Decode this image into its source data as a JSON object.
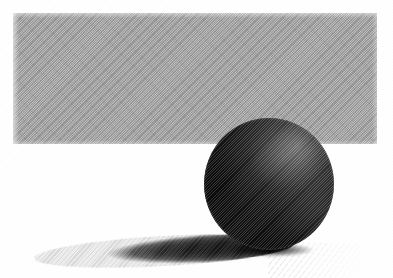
{
  "image": {
    "title": "Dark sphere resting on a surface in front of a gray band",
    "medium": "grayscale halftone print",
    "width_px": 393,
    "height_px": 278,
    "background_color": "#ffffff"
  },
  "objects": {
    "band": {
      "name": "gray background band",
      "shape": "rectangle",
      "color": "#ababab",
      "x_px": 13,
      "y_px": 13,
      "width_px": 364,
      "height_px": 131,
      "texture": "diagonal halftone screen"
    },
    "sphere": {
      "name": "dark sphere",
      "shape": "circle",
      "color_dark": "#151515",
      "color_light": "#7a7a7a",
      "x_px": 204,
      "y_px": 118,
      "diameter_px": 130,
      "highlight_position": "upper right",
      "texture": "diagonal halftone screen"
    },
    "shadow": {
      "name": "cast shadow",
      "shape": "ellipse",
      "color": "#161616",
      "x_px": 34,
      "y_px": 236,
      "width_px": 260,
      "height_px": 30,
      "direction": "to the left of the sphere",
      "rotation_deg": -3.2
    },
    "floor_streaks": {
      "name": "faint floor streaks",
      "color": "#000000",
      "opacity": 0.085,
      "x_px": 268,
      "y_px": 243,
      "width_px": 125,
      "height_px": 35
    },
    "contact": {
      "name": "sphere ground contact shading",
      "x_px": 228,
      "y_px": 243,
      "width_px": 86,
      "height_px": 14
    }
  },
  "labels": {
    "scene_caption": "Dark sphere resting on a surface in front of a gray band",
    "band_caption": "Gray background band",
    "sphere_caption": "Dark sphere with highlight on upper right",
    "shadow_caption": "Long cast shadow extending left"
  }
}
